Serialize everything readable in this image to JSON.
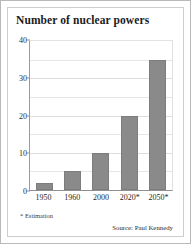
{
  "chart_data": {
    "type": "bar",
    "title": "Number of nuclear powers",
    "categories": [
      "1950",
      "1960",
      "2000",
      "2020*",
      "2050*"
    ],
    "values": [
      2,
      5,
      10,
      20,
      35
    ],
    "xlabel": "",
    "ylabel": "",
    "ylim": [
      0,
      40
    ],
    "y_ticks": [
      0,
      10,
      20,
      30,
      40
    ],
    "y_tick_labels": [
      "0",
      "10",
      "20",
      "30",
      "40"
    ],
    "minor_gridlines": [
      5,
      15,
      25,
      35
    ],
    "grid": true,
    "legend": null,
    "bar_color": "#8a8a8a",
    "annotations": {
      "footnote": "* Estimation",
      "source": "Source: Paul Kennedy"
    }
  }
}
